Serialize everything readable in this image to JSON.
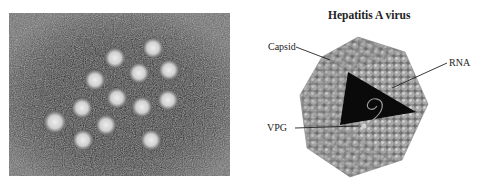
{
  "figure": {
    "left_panel": {
      "type": "electron-micrograph",
      "subject": "hepatitis A virus particles",
      "particle_count": 15
    },
    "right_panel": {
      "title": "Hepatitis A virus",
      "labels": {
        "capsid": "Capsid",
        "rna": "RNA",
        "vpg": "VPG"
      }
    }
  },
  "colors": {
    "background": "#ffffff",
    "micrograph_dark": "#1a1a1a",
    "micrograph_mid": "#5a5a5a",
    "particle": "#d8d8d8",
    "capsid_sphere": "#9a9a9a",
    "rna_core": "#0a0a0a",
    "text": "#222222"
  }
}
